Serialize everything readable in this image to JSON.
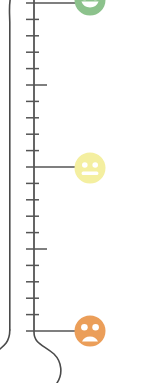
{
  "widget": {
    "name": "mood-thermometer",
    "type": "vertical thermometer scale with mood faces",
    "background_color": "#ffffff",
    "outline_color": "#4a4a4a",
    "tick_color": "#555555"
  },
  "thermometer": {
    "tube_left_x": 10,
    "tube_scale_x": 34,
    "bulb_center_x": 36,
    "bulb_center_y": 365,
    "bulb_radius": 26,
    "tick_count": 21,
    "tick_top_y": 3,
    "tick_spacing": 16.4,
    "short_tick_length": 13,
    "medium_tick_length": 21,
    "long_tick_length": 53,
    "long_tick_indices": [
      0,
      10,
      20
    ],
    "medium_tick_indices": [
      5,
      15
    ]
  },
  "faces": [
    {
      "id": "happy-face",
      "label": "happy",
      "expression": "smile",
      "color": "#8cc28c",
      "eye_color": "#ffffff",
      "center_x": 90,
      "center_y": 0,
      "diameter": 32,
      "clipped": "top"
    },
    {
      "id": "neutral-face",
      "label": "neutral",
      "expression": "flat",
      "color": "#f4efa0",
      "eye_color": "#ffffff",
      "center_x": 90,
      "center_y": 168,
      "diameter": 32,
      "clipped": "none"
    },
    {
      "id": "sad-face",
      "label": "sad",
      "expression": "frown",
      "color": "#eb9e59",
      "eye_color": "#ffffff",
      "center_x": 90,
      "center_y": 331,
      "diameter": 32,
      "clipped": "none"
    }
  ],
  "chart_data": {
    "type": "bar",
    "title": "",
    "xlabel": "",
    "ylabel": "",
    "categories": [
      "happy",
      "neutral",
      "sad"
    ],
    "values": [
      20,
      10,
      0
    ],
    "ylim": [
      0,
      20
    ],
    "grid": false,
    "legend": "none",
    "tick_labels": []
  }
}
